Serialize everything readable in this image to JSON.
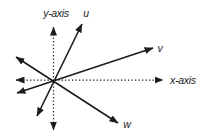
{
  "diagram": {
    "background_color": "#ffffff",
    "stroke_color": "#1c1c1c",
    "axes": {
      "x_label": "x-axis",
      "y_label": "y-axis"
    },
    "vectors": [
      {
        "label": "u"
      },
      {
        "label": "v"
      },
      {
        "label": "w"
      }
    ]
  }
}
